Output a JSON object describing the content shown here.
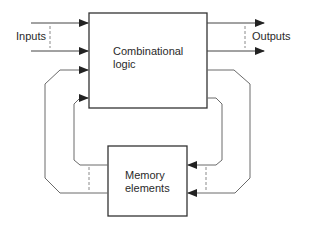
{
  "diagram": {
    "blocks": {
      "combinational": {
        "line1": "Combinational",
        "line2": "logic"
      },
      "memory": {
        "line1": "Memory",
        "line2": "elements"
      }
    },
    "labels": {
      "inputs": "Inputs",
      "outputs": "Outputs"
    },
    "colors": {
      "line": "#3a3a3a",
      "feedback": "#7a7a7a",
      "dashed": "#8a8a8a"
    }
  }
}
